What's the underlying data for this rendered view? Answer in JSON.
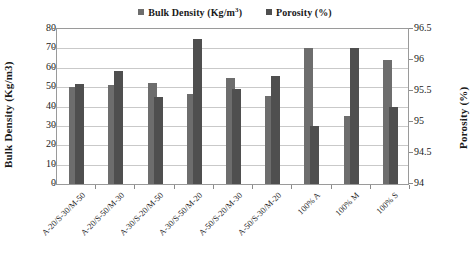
{
  "chart_data": {
    "type": "bar",
    "title": "",
    "xlabel": "",
    "ylabel": "Bulk Density (Kg/m3)",
    "y2label": "Porosity (%)",
    "ylim": [
      0,
      80
    ],
    "y2lim": [
      94,
      96.5
    ],
    "yticks": [
      "80",
      "70",
      "60",
      "50",
      "40",
      "30",
      "20",
      "10",
      "0"
    ],
    "y2ticks": [
      "96.5",
      "96",
      "95.5",
      "95",
      "94.5",
      "94"
    ],
    "grid": true,
    "legend_position": "top-center",
    "categories": [
      "A-20/S-30/M-50",
      "A-20/S-50/M-30",
      "A-30/S-20/M-50",
      "A-30/S-50/M-20",
      "A-50/S-20/M-30",
      "A-50/S-30/M-20",
      "100% A",
      "100% M",
      "100% S"
    ],
    "series": [
      {
        "name": "Bulk Density (Kg/m³)",
        "color": "#6d6d6d",
        "axis": "left",
        "values": [
          50.0,
          51.0,
          52.0,
          46.5,
          54.5,
          45.5,
          70.0,
          35.0,
          64.0
        ]
      },
      {
        "name": "Porosity (%)",
        "color": "#4f4f4f",
        "axis": "right",
        "values": [
          51.5,
          58.5,
          45.0,
          75.0,
          49.0,
          56.0,
          30.0,
          70.0,
          40.0
        ]
      }
    ]
  },
  "legend": {
    "items": [
      {
        "label_main": "Bulk Density (Kg/m",
        "label_sup": "3",
        "label_end": ")"
      },
      {
        "label_main": "Porosity (%)",
        "label_sup": "",
        "label_end": ""
      }
    ]
  },
  "axes": {
    "left_title": "Bulk Density (Kg/m3)",
    "right_title": "Porosity (%)"
  }
}
